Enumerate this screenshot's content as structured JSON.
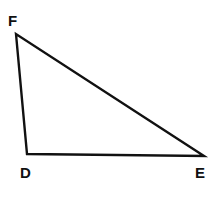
{
  "diagram": {
    "type": "triangle",
    "vertices": [
      {
        "label": "F",
        "x": 16,
        "y": 34,
        "lx": 8,
        "ly": 26
      },
      {
        "label": "D",
        "x": 27,
        "y": 154,
        "lx": 20,
        "ly": 178
      },
      {
        "label": "E",
        "x": 204,
        "y": 156,
        "lx": 195,
        "ly": 178
      }
    ],
    "stroke_color": "#111111",
    "background": "#ffffff"
  }
}
